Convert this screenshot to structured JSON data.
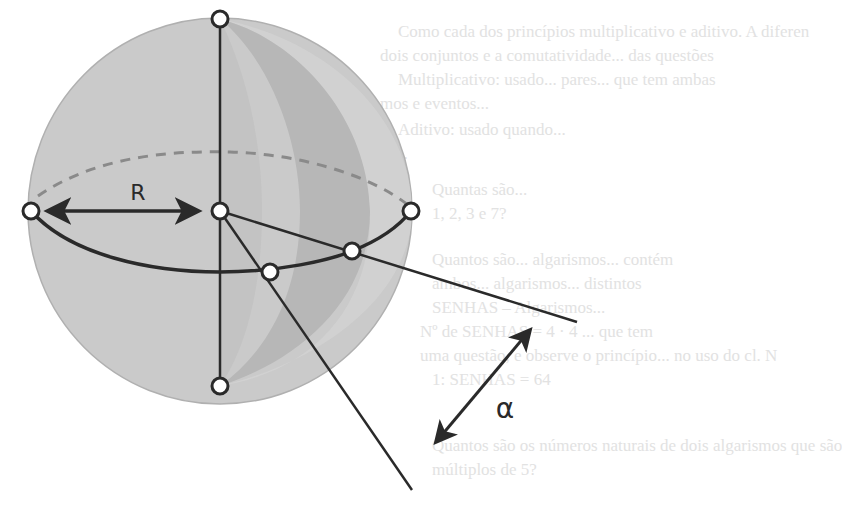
{
  "diagram": {
    "labels": {
      "radius": "R",
      "angle": "α"
    },
    "colors": {
      "sphere_fill": "#c9c9c9",
      "sphere_edge": "#a8a8a8",
      "lune_dark": "#b4b4b4",
      "lune_mid": "#bdbdbd",
      "stroke": "#2a2a2a",
      "dashed": "#8a8a8a",
      "node_fill": "#ffffff"
    },
    "nodes": [
      {
        "name": "north-pole",
        "x": 220,
        "y": 19
      },
      {
        "name": "south-pole",
        "x": 220,
        "y": 386
      },
      {
        "name": "center",
        "x": 220,
        "y": 211
      },
      {
        "name": "equator-left",
        "x": 31,
        "y": 211
      },
      {
        "name": "equator-right",
        "x": 411,
        "y": 211
      },
      {
        "name": "wedge-edge-1",
        "x": 270,
        "y": 272
      },
      {
        "name": "wedge-edge-2",
        "x": 352,
        "y": 251
      }
    ]
  },
  "bleed_through_text": [
    "Como cada dos princípios multiplicativo e aditivo. A diferen",
    "dois conjuntos e a comutatividade... das questões",
    "Multiplicativo: usado... pares... que tem ambas",
    "mos e eventos...",
    "Aditivo: usado quando...",
    "nos.",
    "Quantas são... ",
    "1, 2, 3 e 7?",
    "Quantos são... algarismos... contém",
    "ambos... algarismos... distintos",
    "SENHAS – Algarismos...",
    "Nº de SENHAS = 4 · 4 ... que tem",
    "uma questão, e observe o princípio... no uso do cl. N",
    "1: SENHAS = 64",
    "Quantos são os números naturais de dois algarismos que são",
    "múltiplos de 5?"
  ]
}
